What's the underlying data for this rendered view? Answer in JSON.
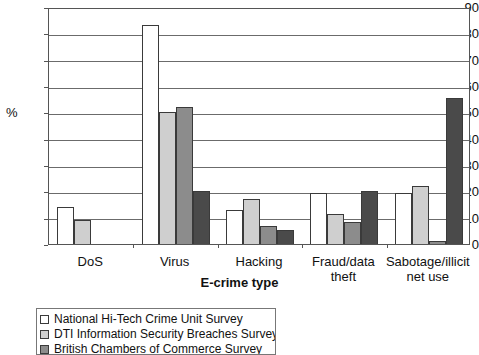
{
  "chart_data": {
    "type": "bar",
    "title": "",
    "xlabel": "E-crime type",
    "ylabel": "%",
    "ylim": [
      0,
      90
    ],
    "ytick_step": 10,
    "yticks": [
      90,
      80,
      70,
      60,
      50,
      40,
      30,
      20,
      10,
      0
    ],
    "grid": true,
    "legend_position": "below-left",
    "categories": [
      "DoS",
      "Virus",
      "Hacking",
      "Fraud/data theft",
      "Sabotage/illicit net use"
    ],
    "category_labels": [
      [
        "DoS"
      ],
      [
        "Virus"
      ],
      [
        "Hacking"
      ],
      [
        "Fraud/data",
        "theft"
      ],
      [
        "Sabotage/illicit",
        "net use"
      ]
    ],
    "series": [
      {
        "name": "National Hi-Tech Crime Unit Survey",
        "color": "#ffffff",
        "values": [
          14,
          83,
          13,
          19.5,
          19.5
        ]
      },
      {
        "name": "DTI Information Security Breaches Survey",
        "color": "#cfcfcf",
        "values": [
          9,
          50,
          17,
          11.5,
          22
        ]
      },
      {
        "name": "British Chambers of Commerce Survey",
        "color": "#8c8c8c",
        "values": [
          null,
          52,
          7,
          8.5,
          1
        ]
      },
      {
        "name": "",
        "color": "#4a4a4a",
        "values": [
          null,
          20,
          5.5,
          20,
          55.5
        ]
      }
    ]
  },
  "legend": {
    "items": [
      {
        "label": "National Hi-Tech Crime Unit Survey",
        "color": "#ffffff"
      },
      {
        "label": "DTI Information Security Breaches Survey",
        "color": "#cfcfcf"
      },
      {
        "label": "British Chambers of Commerce Survey",
        "color": "#8c8c8c"
      }
    ]
  }
}
